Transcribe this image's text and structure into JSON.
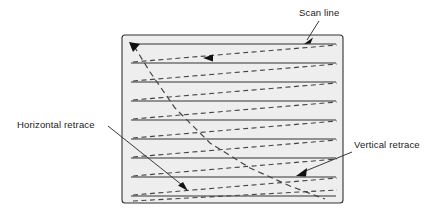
{
  "figure": {
    "background_color": "#ffffff",
    "screen": {
      "name": "screen-rectangle",
      "x": 122,
      "y": 35,
      "width": 221,
      "height": 168,
      "fill_color": "#eeeeee",
      "stroke_color": "#333333",
      "corner_radius": 3
    },
    "line_colors": {
      "scan_line": "#333333",
      "retrace_line": "#444444",
      "leader_line": "#3a3a3a",
      "arrow_fill": "#111111"
    },
    "scan_lines": {
      "name": "scan-lines",
      "count": 9,
      "x_start": 131,
      "x_end": 336,
      "y_values": [
        44,
        63,
        82,
        101,
        120,
        139,
        158,
        177,
        196
      ],
      "style": "solid"
    },
    "horizontal_retraces": {
      "name": "horizontal-retrace-lines",
      "count": 9,
      "style": "dashed",
      "description": "Dashed lines sloping up from left edge to right edge between successive scan lines",
      "segments": [
        {
          "x1": 133,
          "y1": 62,
          "x2": 337,
          "y2": 45
        },
        {
          "x1": 133,
          "y1": 81,
          "x2": 337,
          "y2": 64
        },
        {
          "x1": 133,
          "y1": 100,
          "x2": 337,
          "y2": 83
        },
        {
          "x1": 133,
          "y1": 119,
          "x2": 337,
          "y2": 102
        },
        {
          "x1": 133,
          "y1": 138,
          "x2": 337,
          "y2": 121
        },
        {
          "x1": 133,
          "y1": 157,
          "x2": 337,
          "y2": 140
        },
        {
          "x1": 133,
          "y1": 176,
          "x2": 337,
          "y2": 159
        },
        {
          "x1": 133,
          "y1": 195,
          "x2": 337,
          "y2": 178
        },
        {
          "x1": 133,
          "y1": 201,
          "x2": 337,
          "y2": 190
        }
      ]
    },
    "vertical_retrace_path": {
      "name": "vertical-retrace-path",
      "style": "dashed",
      "description": "Long dashed diagonal running from upper-left down to lower-right, then back up to the start",
      "points": "134,46 150,72 175,108 210,143 250,168 290,186 325,199"
    },
    "arrows": [
      {
        "name": "scan-start-arrowhead",
        "x": 134,
        "y": 46,
        "direction": "down-left"
      },
      {
        "name": "horizontal-retrace-arrowhead",
        "x": 210,
        "y": 58,
        "direction": "left"
      },
      {
        "name": "horizontal-retrace-leader-arrowhead",
        "x": 186,
        "y": 189,
        "direction": "down-right"
      },
      {
        "name": "vertical-retrace-leader-arrowhead",
        "x": 298,
        "y": 176,
        "direction": "down-left"
      },
      {
        "name": "scan-line-leader-arrowhead",
        "x": 305,
        "y": 43,
        "direction": "down-left"
      }
    ],
    "labels": [
      {
        "name": "scan-line-label",
        "text": "Scan line",
        "text_x": 299,
        "text_y": 16,
        "anchor": "start",
        "leader": {
          "x1": 318,
          "y1": 21,
          "x2": 306,
          "y2": 41
        }
      },
      {
        "name": "horizontal-retrace-label",
        "text": "Horizontal retrace",
        "text_x": 17,
        "text_y": 128,
        "anchor": "start",
        "leader": {
          "x1": 108,
          "y1": 126,
          "x2": 184,
          "y2": 187
        }
      },
      {
        "name": "vertical-retrace-label",
        "text": "Vertical retrace",
        "text_x": 354,
        "text_y": 148,
        "anchor": "start",
        "leader": {
          "x1": 352,
          "y1": 152,
          "x2": 300,
          "y2": 174
        }
      }
    ]
  }
}
